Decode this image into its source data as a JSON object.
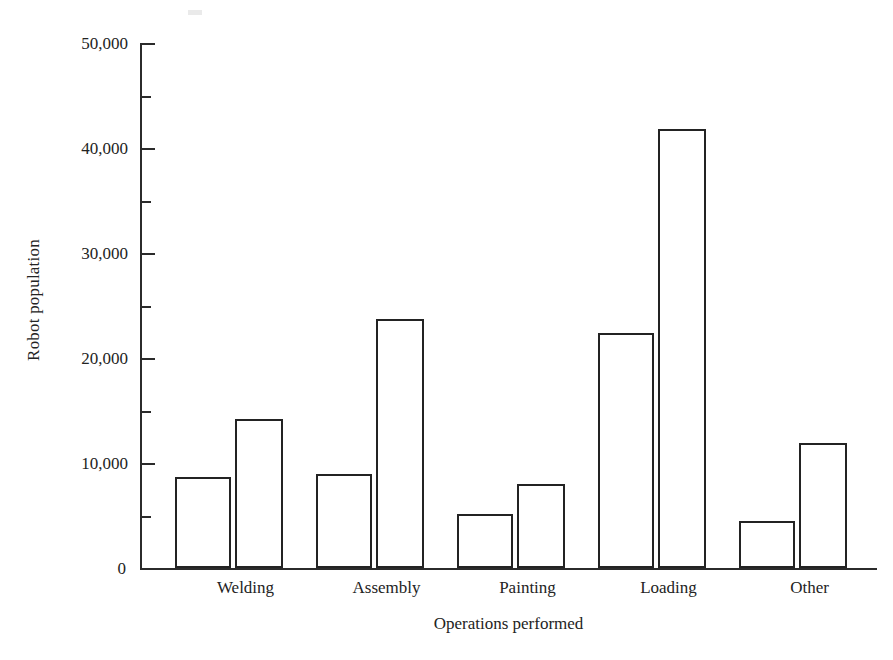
{
  "chart_data": {
    "type": "bar",
    "title": "",
    "subtitle": "",
    "xlabel": "Operations performed",
    "ylabel": "Robot population",
    "categories": [
      "Welding",
      "Assembly",
      "Painting",
      "Loading",
      "Other"
    ],
    "series": [
      {
        "name": "series-1",
        "values": [
          8700,
          9000,
          5100,
          22400,
          4500
        ]
      },
      {
        "name": "series-2",
        "values": [
          14200,
          23700,
          8000,
          41800,
          11900
        ]
      }
    ],
    "ylim": [
      0,
      50000
    ],
    "ytick_values": [
      0,
      5000,
      10000,
      15000,
      20000,
      25000,
      30000,
      35000,
      40000,
      45000,
      50000
    ],
    "ytick_labels_major": [
      "0",
      "10,000",
      "20,000",
      "30,000",
      "40,000",
      "50,000"
    ],
    "ytick_major_values": [
      0,
      10000,
      20000,
      30000,
      40000,
      50000
    ],
    "ytick_minor_values": [
      5000,
      15000,
      25000,
      35000,
      45000
    ],
    "grid": false,
    "legend": "none",
    "bar_style": "open-outline",
    "colors": {
      "bar_outline": "#232323",
      "bar_fill": "#ffffff",
      "axis": "#2b2b2b",
      "text": "#232323",
      "background": "#ffffff"
    }
  },
  "axis": {
    "y_title": "Robot population",
    "x_title": "Operations performed",
    "tick_labels": {
      "t0": "0",
      "t10000": "10,000",
      "t20000": "20,000",
      "t30000": "30,000",
      "t40000": "40,000",
      "t50000": "50,000"
    }
  },
  "categories": {
    "c0": "Welding",
    "c1": "Assembly",
    "c2": "Painting",
    "c3": "Loading",
    "c4": "Other"
  },
  "caption": {
    "clipped_text": ""
  }
}
